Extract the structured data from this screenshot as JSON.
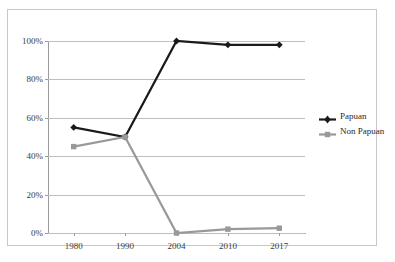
{
  "chart_data": {
    "type": "line",
    "title": "",
    "subtitle": "",
    "xlabel": "",
    "ylabel": "",
    "categories": [
      "1980",
      "1990",
      "2004",
      "2010",
      "2017"
    ],
    "series": [
      {
        "name": "Papuan",
        "values": [
          55,
          50,
          100,
          98,
          98
        ],
        "color": "#1a1a1a",
        "marker": "diamond"
      },
      {
        "name": "Non Papuan",
        "values": [
          45,
          50,
          0,
          2,
          2.5
        ],
        "color": "#999999",
        "marker": "square"
      }
    ],
    "ylim": [
      0,
      100
    ],
    "ytick_values": [
      0,
      20,
      40,
      60,
      80,
      100
    ],
    "ytick_labels": [
      "0%",
      "20%",
      "40%",
      "60%",
      "80%",
      "100%"
    ],
    "grid": true,
    "grid_axis": "y",
    "legend_position": "right",
    "annotations": []
  },
  "legend": {
    "items": [
      {
        "label": "Papuan"
      },
      {
        "label": "Non Papuan"
      }
    ]
  },
  "colors": {
    "papuan": "#1a1a1a",
    "non_papuan": "#999999",
    "gridline": "#bfbfbf",
    "axis": "#9a9a9a",
    "frame": "#c8c8c8",
    "text": "#3a3a3a",
    "background": "#ffffff"
  }
}
